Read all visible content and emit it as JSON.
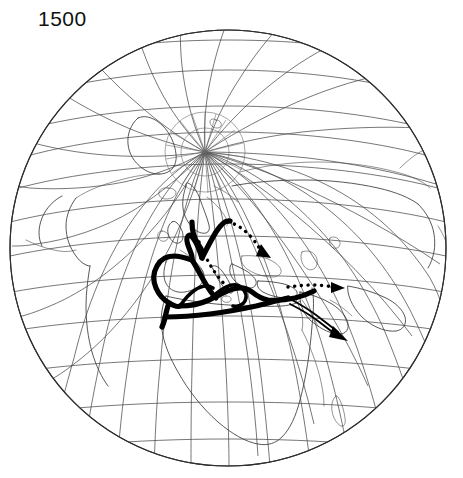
{
  "figure": {
    "name": "world-trade-routes-globe",
    "year_label": "1500",
    "projection": "orthographic",
    "background_color": "#ffffff",
    "line_color": "#3a3a3a",
    "route_color": "#000000",
    "globe": {
      "center_x": 228,
      "center_y": 248,
      "radius": 218,
      "center_latitude": 30,
      "center_longitude": 20,
      "graticule_spacing_degrees": 15
    }
  },
  "map": {
    "title_caption": "1500",
    "landmasses": [
      "Europe",
      "Africa",
      "Asia",
      "Greenland",
      "North America",
      "Arabian Peninsula",
      "British Isles",
      "Scandinavia",
      "Iceland",
      "Madagascar"
    ],
    "features": [
      "north-pole-graticule-convergence",
      "mediterranean-sea",
      "equator",
      "arctic-ocean"
    ]
  },
  "routes": {
    "legend_note": "",
    "items": [
      {
        "id": "mediterranean-core",
        "label": "Mediterranean and European trade network",
        "style": "solid-thick",
        "color": "#000000"
      },
      {
        "id": "atlantic-iberia",
        "label": "Atlantic Iberian coastal route",
        "style": "solid-thick",
        "color": "#000000"
      },
      {
        "id": "north-sea-baltic",
        "label": "North Sea and Baltic route",
        "style": "solid-thick",
        "color": "#000000"
      },
      {
        "id": "baltic-to-northeast",
        "label": "Route northeast toward Russia",
        "style": "dotted",
        "color": "#000000",
        "arrow": "northeast"
      },
      {
        "id": "central-europe-dotted",
        "label": "Overland central European route",
        "style": "dotted",
        "color": "#000000"
      },
      {
        "id": "levant-to-east",
        "label": "Route east toward Central Asia",
        "style": "dotted",
        "color": "#000000",
        "arrow": "east"
      },
      {
        "id": "red-sea-indian-ocean",
        "label": "Route southeast toward the Indian Ocean",
        "style": "solid-arrow",
        "color": "#000000",
        "arrow": "southeast"
      }
    ]
  }
}
